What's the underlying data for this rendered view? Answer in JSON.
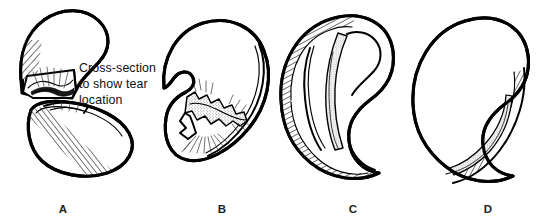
{
  "figure": {
    "background_color": "#ffffff",
    "ink_color": "#000000",
    "width": 545,
    "height": 223,
    "style": "black-and-white pen-and-ink line drawing"
  },
  "annotation": {
    "line1": "Cross-section",
    "line2": "to show tear",
    "line3": "location",
    "text_color": "#111111",
    "panel": "A"
  },
  "panels": [
    {
      "letter": "A",
      "label_x": 63,
      "label_y": 213,
      "description": "Meniscus separated into an upper hook-shaped fragment and a lower bean-shaped fragment, with a cut cross-section face exposing the tear",
      "tear_type": "cross-section view of tear location",
      "shading": "diagonal hatching along inner rim, stippled tear face, radiating hatch rays"
    },
    {
      "letter": "B",
      "label_x": 222,
      "label_y": 213,
      "description": "C-shaped meniscus with a jagged zigzag flap tear in the central body",
      "tear_type": "complex flap tear",
      "shading": "stippled jagged tear band with fine radiating hatch rays"
    },
    {
      "letter": "C",
      "label_x": 353,
      "label_y": 213,
      "description": "C-shaped meniscus with a long stippled band running parallel to the outer curve",
      "tear_type": "longitudinal bucket-handle tear",
      "shading": "diagonal hatched outer rim with stippled longitudinal tear band"
    },
    {
      "letter": "D",
      "label_x": 488,
      "label_y": 213,
      "description": "C-shaped meniscus with a hatched tear region along the lower posterior horn",
      "tear_type": "posterior horn tear",
      "shading": "diagonal hatched rim band with narrow inner tear sliver"
    }
  ]
}
